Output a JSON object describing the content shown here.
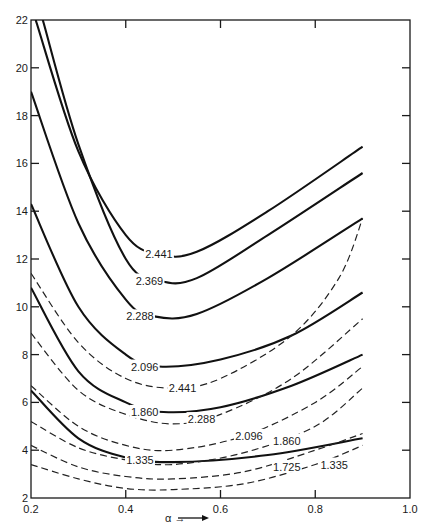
{
  "chart_data": {
    "type": "line",
    "title": "",
    "xlabel": "α →",
    "ylabel": "",
    "xlim": [
      0.2,
      1.0
    ],
    "ylim": [
      2,
      22
    ],
    "x_ticks": [
      "0.2",
      "0.4",
      "0.6",
      "0.8",
      "1.0"
    ],
    "y_ticks": [
      "2",
      "4",
      "6",
      "8",
      "10",
      "12",
      "14",
      "16",
      "18",
      "20",
      "22"
    ],
    "grid": false,
    "legend": "none (inline curve labels)",
    "series": [
      {
        "name": "2.441",
        "style": "solid",
        "label_at": [
          0.47,
          12.2
        ],
        "points": [
          [
            0.21,
            22
          ],
          [
            0.3,
            16.5
          ],
          [
            0.4,
            13.0
          ],
          [
            0.47,
            12.2
          ],
          [
            0.55,
            12.3
          ],
          [
            0.7,
            14.0
          ],
          [
            0.9,
            16.7
          ]
        ]
      },
      {
        "name": "2.369",
        "style": "solid",
        "label_at": [
          0.45,
          11.1
        ],
        "points": [
          [
            0.225,
            22
          ],
          [
            0.3,
            16.8
          ],
          [
            0.4,
            12.0
          ],
          [
            0.47,
            11.1
          ],
          [
            0.55,
            11.2
          ],
          [
            0.7,
            13.0
          ],
          [
            0.9,
            15.6
          ]
        ]
      },
      {
        "name": "2.288",
        "style": "solid",
        "label_at": [
          0.43,
          9.6
        ],
        "points": [
          [
            0.2,
            19
          ],
          [
            0.3,
            13.5
          ],
          [
            0.4,
            10.3
          ],
          [
            0.46,
            9.6
          ],
          [
            0.55,
            9.7
          ],
          [
            0.7,
            11.2
          ],
          [
            0.9,
            13.7
          ]
        ]
      },
      {
        "name": "2.096",
        "style": "solid",
        "label_at": [
          0.44,
          7.5
        ],
        "points": [
          [
            0.2,
            14.3
          ],
          [
            0.3,
            10.0
          ],
          [
            0.4,
            8.0
          ],
          [
            0.47,
            7.5
          ],
          [
            0.6,
            7.8
          ],
          [
            0.75,
            8.8
          ],
          [
            0.9,
            10.6
          ]
        ]
      },
      {
        "name": "1.860",
        "style": "solid",
        "label_at": [
          0.44,
          5.6
        ],
        "points": [
          [
            0.2,
            10.8
          ],
          [
            0.3,
            7.3
          ],
          [
            0.4,
            6.0
          ],
          [
            0.48,
            5.6
          ],
          [
            0.6,
            5.8
          ],
          [
            0.75,
            6.7
          ],
          [
            0.9,
            8.0
          ]
        ]
      },
      {
        "name": "1.335",
        "style": "solid",
        "label_at": [
          0.43,
          3.6
        ],
        "points": [
          [
            0.2,
            6.5
          ],
          [
            0.3,
            4.5
          ],
          [
            0.4,
            3.7
          ],
          [
            0.5,
            3.5
          ],
          [
            0.7,
            3.8
          ],
          [
            0.9,
            4.5
          ]
        ]
      },
      {
        "name": "2.441",
        "style": "dashed",
        "label_at": [
          0.52,
          6.6
        ],
        "points": [
          [
            0.2,
            11.4
          ],
          [
            0.3,
            8.5
          ],
          [
            0.4,
            7.0
          ],
          [
            0.5,
            6.6
          ],
          [
            0.6,
            7.0
          ],
          [
            0.75,
            8.8
          ],
          [
            0.85,
            11.2
          ],
          [
            0.9,
            13.7
          ]
        ]
      },
      {
        "name": "2.288",
        "style": "dashed",
        "label_at": [
          0.56,
          5.3
        ],
        "points": [
          [
            0.2,
            8.9
          ],
          [
            0.3,
            6.5
          ],
          [
            0.4,
            5.5
          ],
          [
            0.5,
            5.1
          ],
          [
            0.6,
            5.5
          ],
          [
            0.75,
            7.0
          ],
          [
            0.9,
            9.5
          ]
        ]
      },
      {
        "name": "2.096",
        "style": "dashed",
        "label_at": [
          0.66,
          4.6
        ],
        "points": [
          [
            0.2,
            6.7
          ],
          [
            0.3,
            5.0
          ],
          [
            0.4,
            4.2
          ],
          [
            0.5,
            4.0
          ],
          [
            0.65,
            4.6
          ],
          [
            0.8,
            6.0
          ],
          [
            0.9,
            7.5
          ]
        ]
      },
      {
        "name": "1.860",
        "style": "dashed",
        "label_at": [
          0.74,
          4.4
        ],
        "points": [
          [
            0.2,
            5.2
          ],
          [
            0.3,
            4.1
          ],
          [
            0.4,
            3.6
          ],
          [
            0.5,
            3.4
          ],
          [
            0.65,
            3.9
          ],
          [
            0.8,
            5.0
          ],
          [
            0.9,
            6.6
          ]
        ]
      },
      {
        "name": "1.725",
        "style": "dashed",
        "label_at": [
          0.74,
          3.3
        ],
        "points": [
          [
            0.2,
            4.2
          ],
          [
            0.3,
            3.3
          ],
          [
            0.4,
            2.9
          ],
          [
            0.5,
            2.8
          ],
          [
            0.65,
            3.1
          ],
          [
            0.8,
            4.0
          ],
          [
            0.9,
            4.7
          ]
        ]
      },
      {
        "name": "1.335",
        "style": "dashed",
        "label_at": [
          0.84,
          3.4
        ],
        "points": [
          [
            0.2,
            3.4
          ],
          [
            0.3,
            2.8
          ],
          [
            0.4,
            2.4
          ],
          [
            0.5,
            2.35
          ],
          [
            0.65,
            2.6
          ],
          [
            0.8,
            3.4
          ],
          [
            0.9,
            4.2
          ]
        ]
      }
    ]
  }
}
